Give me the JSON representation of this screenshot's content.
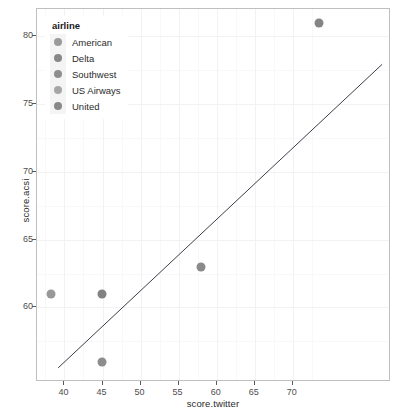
{
  "chart_data": {
    "type": "scatter",
    "title": "",
    "xlabel": "score.twitter",
    "ylabel": "score.acsi",
    "xlim": [
      36.4,
      82.9
    ],
    "ylim": [
      54.5,
      82.0
    ],
    "xticks": [
      40,
      45,
      50,
      55,
      60,
      65,
      70
    ],
    "xtick_labels": [
      "40",
      "45",
      "50",
      "55",
      "60",
      "65",
      "70"
    ],
    "yticks": [
      60,
      65,
      70,
      75,
      80
    ],
    "ytick_labels": [
      "60",
      "65",
      "70",
      "75",
      "80"
    ],
    "x_minor_ticks": [
      37.5,
      42.5,
      47.5,
      52.5,
      57.5,
      62.5,
      67.5,
      72.5
    ],
    "y_minor_ticks": [
      57.5,
      62.5,
      67.5,
      72.5,
      77.5
    ],
    "grid": true,
    "legend_position": "top-left-inside",
    "points": [
      {
        "label": "American",
        "x": 38.2,
        "y": 61.0,
        "color": "#989898"
      },
      {
        "label": "Delta",
        "x": 44.9,
        "y": 61.0,
        "color": "#828282"
      },
      {
        "label": "Southwest",
        "x": 44.9,
        "y": 56.0,
        "color": "#8d8d8d"
      },
      {
        "label": "US Airways",
        "x": 58.0,
        "y": 63.0,
        "color": "#8a8a8a"
      },
      {
        "label": "United",
        "x": 73.4,
        "y": 81.0,
        "color": "#848484"
      }
    ],
    "trendline": {
      "type": "linear-fit",
      "color": "#3b3b4a",
      "x_start": 39.2,
      "y_start": 55.4,
      "x_end": 82.0,
      "y_end": 77.9
    }
  },
  "legend": {
    "title": "airline",
    "items": [
      {
        "label": "American",
        "color": "#9a9a9a"
      },
      {
        "label": "Delta",
        "color": "#878787"
      },
      {
        "label": "Southwest",
        "color": "#8e8e8e"
      },
      {
        "label": "US Airways",
        "color": "#a6a6a6"
      },
      {
        "label": "United",
        "color": "#888888"
      }
    ]
  }
}
